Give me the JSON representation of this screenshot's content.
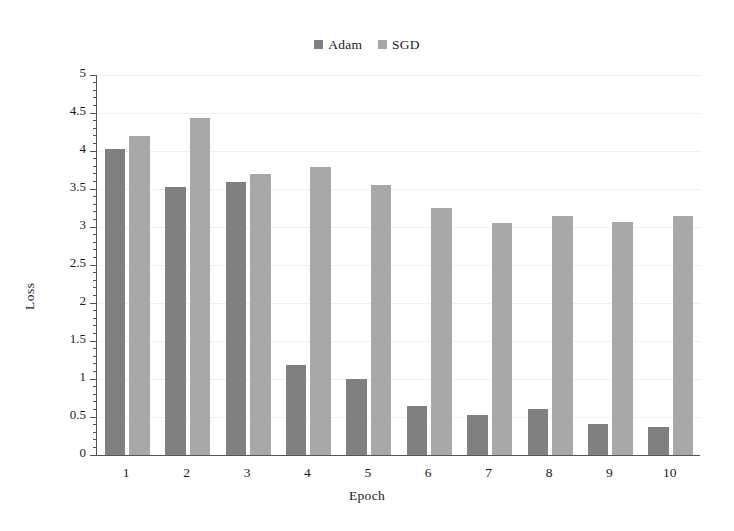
{
  "chart_data": {
    "type": "bar",
    "title": "",
    "xlabel": "Epoch",
    "ylabel": "Loss",
    "categories": [
      "1",
      "2",
      "3",
      "4",
      "5",
      "6",
      "7",
      "8",
      "9",
      "10"
    ],
    "series": [
      {
        "name": "Adam",
        "color": "#808080",
        "values": [
          4.02,
          3.52,
          3.59,
          1.18,
          1.0,
          0.64,
          0.52,
          0.6,
          0.41,
          0.37
        ]
      },
      {
        "name": "SGD",
        "color": "#a8a8a8",
        "values": [
          4.2,
          4.43,
          3.7,
          3.79,
          3.55,
          3.25,
          3.05,
          3.15,
          3.06,
          3.15
        ]
      }
    ],
    "ylim": [
      0,
      5
    ],
    "ytick_step": 0.5,
    "yticks": [
      "0",
      "0.5",
      "1",
      "1.5",
      "2",
      "2.5",
      "3",
      "3.5",
      "4",
      "4.5",
      "5"
    ],
    "grid": true,
    "grid_axis": "y",
    "legend_position": "top-center",
    "minor_ticks": true
  },
  "legend": {
    "entries": [
      {
        "label": "Adam",
        "color": "#808080"
      },
      {
        "label": "SGD",
        "color": "#a8a8a8"
      }
    ]
  },
  "axes": {
    "y_title": "Loss",
    "x_title": "Epoch"
  }
}
